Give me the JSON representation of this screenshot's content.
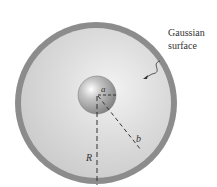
{
  "figure": {
    "labels": {
      "gaussian_line1": "Gaussian",
      "gaussian_line2": "surface",
      "inner_radius": "a",
      "shell_radius": "b",
      "gaussian_radius": "R"
    },
    "colors": {
      "shell": "#8a8a8a",
      "interior": "#d6d6d6",
      "sphere": "#9a9a9a",
      "dashes": "#333333"
    }
  }
}
